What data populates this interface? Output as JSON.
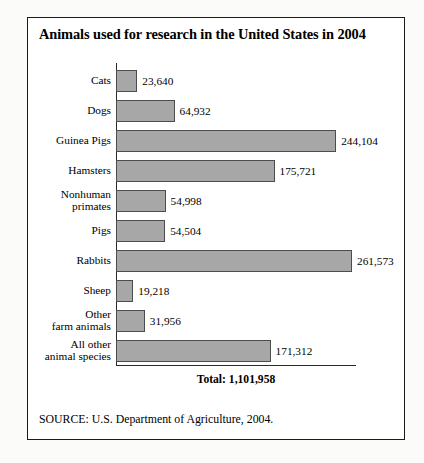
{
  "figure": {
    "title": "Animals used for research in the United States in 2004",
    "total_label": "Total: 1,101,958",
    "source": "SOURCE: U.S. Department of Agriculture, 2004."
  },
  "colors": {
    "bar_fill": "#a7a7a7",
    "bar_border": "#4c4c4c",
    "axis": "#2a2a2a",
    "frame": "#1b1b1b",
    "page_background": "#fbfbf9"
  },
  "chart_data": {
    "type": "bar",
    "orientation": "horizontal",
    "title": "Animals used for research in the United States in 2004",
    "xlabel": "",
    "ylabel": "",
    "grid": false,
    "legend": false,
    "xlim": [
      0,
      261573
    ],
    "categories": [
      "Cats",
      "Dogs",
      "Guinea Pigs",
      "Hamsters",
      "Nonhuman primates",
      "Pigs",
      "Rabbits",
      "Sheep",
      "Other farm animals",
      "All other animal species"
    ],
    "category_lines": [
      [
        "Cats"
      ],
      [
        "Dogs"
      ],
      [
        "Guinea Pigs"
      ],
      [
        "Hamsters"
      ],
      [
        "Nonhuman",
        "primates"
      ],
      [
        "Pigs"
      ],
      [
        "Rabbits"
      ],
      [
        "Sheep"
      ],
      [
        "Other",
        "farm animals"
      ],
      [
        "All other",
        "animal species"
      ]
    ],
    "values": [
      23640,
      64932,
      244104,
      175721,
      54998,
      54504,
      261573,
      19218,
      31956,
      171312
    ],
    "value_labels": [
      "23,640",
      "64,932",
      "244,104",
      "175,721",
      "54,998",
      "54,504",
      "261,573",
      "19,218",
      "31,956",
      "171,312"
    ],
    "total": 1101958,
    "total_label": "Total: 1,101,958",
    "source": "SOURCE: U.S. Department of Agriculture, 2004."
  }
}
